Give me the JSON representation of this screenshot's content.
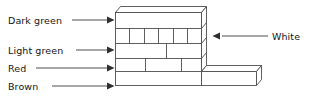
{
  "figure": {
    "type": "labeled-line-drawing",
    "background_color": "#ffffff",
    "stroke_color": "#4d4d4d",
    "text_color": "#151515"
  },
  "labels": {
    "dark_green": "Dark green",
    "light_green": "Light green",
    "red": "Red",
    "brown": "Brown",
    "white": "White"
  },
  "callouts": [
    {
      "name": "dark-green",
      "text": "Dark green",
      "side": "left",
      "target_row": 1
    },
    {
      "name": "light-green",
      "text": "Light green",
      "side": "left",
      "target_row": 3
    },
    {
      "name": "red",
      "text": "Red",
      "side": "left",
      "target_row": 4
    },
    {
      "name": "brown",
      "text": "Brown",
      "side": "left",
      "target_row": 5
    },
    {
      "name": "white",
      "text": "White",
      "side": "right",
      "target_row": 2
    }
  ],
  "wall": {
    "rows": [
      {
        "index": 1,
        "label": "Dark green",
        "bricks": 1
      },
      {
        "index": 2,
        "label": "White",
        "bricks": 6
      },
      {
        "index": 3,
        "label": "Light green",
        "bricks": 2
      },
      {
        "index": 4,
        "label": "Red",
        "bricks": 3
      },
      {
        "index": 5,
        "label": "Brown",
        "bricks": 1
      }
    ],
    "has_right_extension": true,
    "perspective": "isometric-right-and-top-faces"
  }
}
